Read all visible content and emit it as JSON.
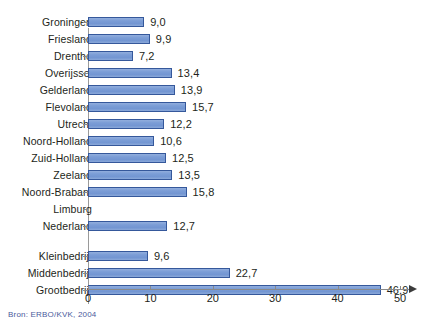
{
  "source_note": "Bron: ERBO/KVK, 2004",
  "axis": {
    "ticks": [
      {
        "value": 0,
        "label": "0"
      },
      {
        "value": 10,
        "label": "10"
      },
      {
        "value": 20,
        "label": "20"
      },
      {
        "value": 30,
        "label": "30"
      },
      {
        "value": 40,
        "label": "40"
      },
      {
        "value": 50,
        "label": "50"
      }
    ]
  },
  "colors": {
    "bar_fill": "#7b9dd6",
    "bar_border": "#35589b",
    "axis": "#8a8a8a",
    "text": "#231f20",
    "source_text": "#4a5a9c"
  },
  "rows": [
    {
      "label": "Groningen",
      "value": 9.0,
      "value_label": "9,0",
      "has_bar": true,
      "gap_before": false
    },
    {
      "label": "Friesland",
      "value": 9.9,
      "value_label": "9,9",
      "has_bar": true,
      "gap_before": false
    },
    {
      "label": "Drenthe",
      "value": 7.2,
      "value_label": "7,2",
      "has_bar": true,
      "gap_before": false
    },
    {
      "label": "Overijssel",
      "value": 13.4,
      "value_label": "13,4",
      "has_bar": true,
      "gap_before": false
    },
    {
      "label": "Gelderland",
      "value": 13.9,
      "value_label": "13,9",
      "has_bar": true,
      "gap_before": false
    },
    {
      "label": "Flevoland",
      "value": 15.7,
      "value_label": "15,7",
      "has_bar": true,
      "gap_before": false
    },
    {
      "label": "Utrecht",
      "value": 12.2,
      "value_label": "12,2",
      "has_bar": true,
      "gap_before": false
    },
    {
      "label": "Noord-Holland",
      "value": 10.6,
      "value_label": "10,6",
      "has_bar": true,
      "gap_before": false
    },
    {
      "label": "Zuid-Holland",
      "value": 12.5,
      "value_label": "12,5",
      "has_bar": true,
      "gap_before": false
    },
    {
      "label": "Zeeland",
      "value": 13.5,
      "value_label": "13,5",
      "has_bar": true,
      "gap_before": false
    },
    {
      "label": "Noord-Brabant",
      "value": 15.8,
      "value_label": "15,8",
      "has_bar": true,
      "gap_before": false
    },
    {
      "label": "Limburg",
      "value": null,
      "value_label": "",
      "has_bar": false,
      "gap_before": false
    },
    {
      "label": "Nederland",
      "value": 12.7,
      "value_label": "12,7",
      "has_bar": true,
      "gap_before": false
    },
    {
      "label": "Kleinbedrijf",
      "value": 9.6,
      "value_label": "9,6",
      "has_bar": true,
      "gap_before": true
    },
    {
      "label": "Middenbedrijf",
      "value": 22.7,
      "value_label": "22,7",
      "has_bar": true,
      "gap_before": false
    },
    {
      "label": "Grootbedrijf",
      "value": 46.9,
      "value_label": "46,9",
      "has_bar": true,
      "gap_before": false
    }
  ],
  "chart_data": {
    "type": "bar",
    "orientation": "horizontal",
    "title": "",
    "subtitle": "",
    "xlabel": "",
    "ylabel": "",
    "xlim": [
      0,
      52
    ],
    "grid": false,
    "legend": null,
    "annotations": [
      "Bron: ERBO/KVK, 2004"
    ],
    "axis_ticks": [
      0,
      10,
      20,
      30,
      40,
      50
    ],
    "categories": [
      "Groningen",
      "Friesland",
      "Drenthe",
      "Overijssel",
      "Gelderland",
      "Flevoland",
      "Utrecht",
      "Noord-Holland",
      "Zuid-Holland",
      "Zeeland",
      "Noord-Brabant",
      "Limburg",
      "Nederland",
      "Kleinbedrijf",
      "Middenbedrijf",
      "Grootbedrijf"
    ],
    "values": [
      9.0,
      9.9,
      7.2,
      13.4,
      13.9,
      15.7,
      12.2,
      10.6,
      12.5,
      13.5,
      15.8,
      null,
      12.7,
      9.6,
      22.7,
      46.9
    ],
    "data_labels": [
      "9,0",
      "9,9",
      "7,2",
      "13,4",
      "13,9",
      "15,7",
      "12,2",
      "10,6",
      "12,5",
      "13,5",
      "15,8",
      "",
      "12,7",
      "9,6",
      "22,7",
      "46,9"
    ],
    "decimal_separator": ","
  }
}
